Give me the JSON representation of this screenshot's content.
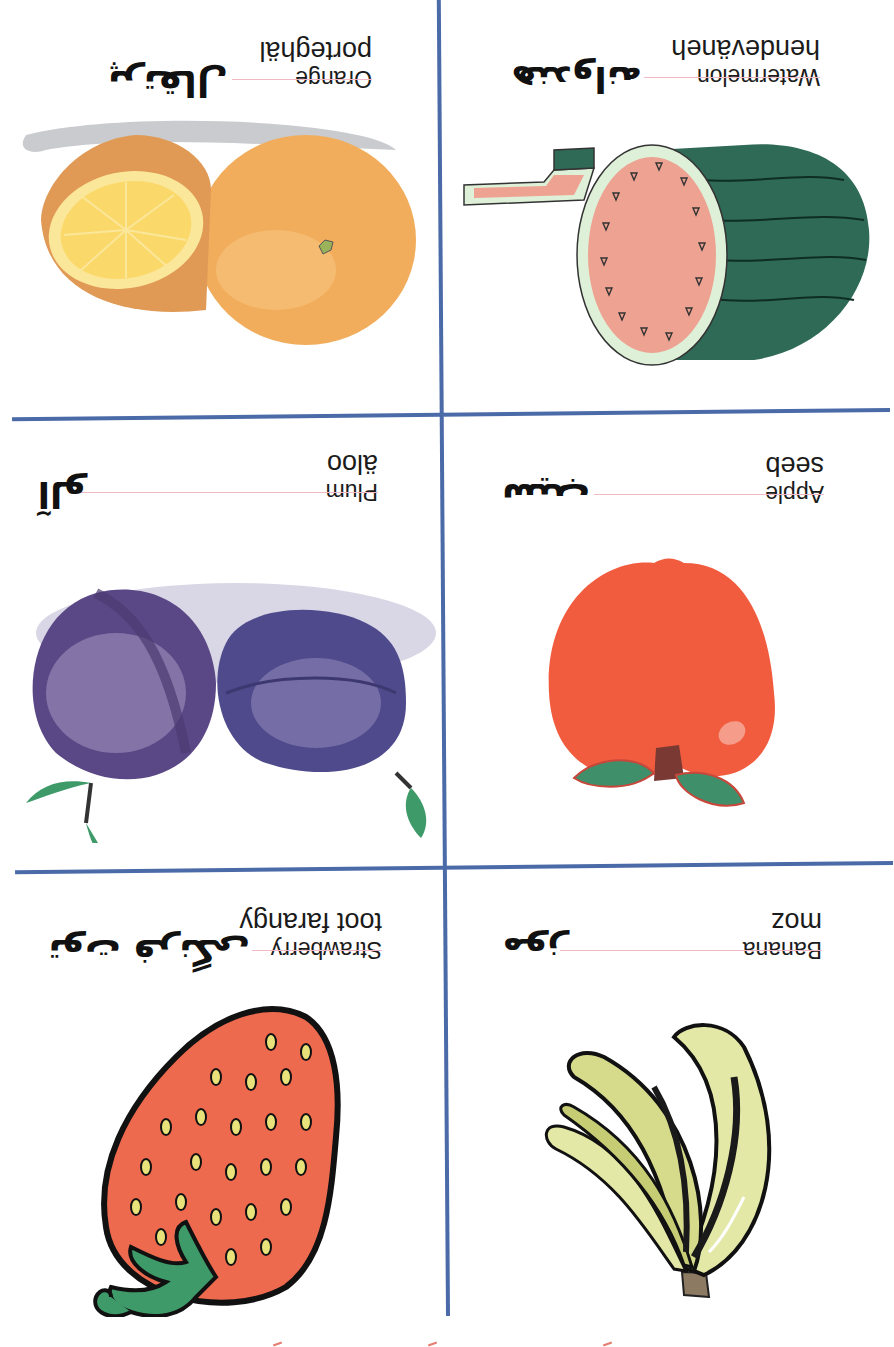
{
  "sheet": {
    "orientation": "rotated-180",
    "grid_color": "#4a6aa8",
    "divider_color": "#f0b9c4"
  },
  "cards": [
    {
      "id": "banana",
      "english": "Banana",
      "transliteration": "moz",
      "persian": "موز",
      "color": "#e4e8a6"
    },
    {
      "id": "strawberry",
      "english": "Strawberry",
      "transliteration": "toot farangy",
      "persian": "توت فرنگی",
      "color": "#ee6a4e"
    },
    {
      "id": "apple",
      "english": "Apple",
      "transliteration": "seeb",
      "persian": "سیب",
      "color": "#f25c3e"
    },
    {
      "id": "plum",
      "english": "Plum",
      "transliteration": "äloo",
      "persian": "آلو",
      "color": "#5a4785"
    },
    {
      "id": "watermelon",
      "english": "Watermelon",
      "transliteration": "hendeväneh",
      "persian": "هندوانه",
      "color": "#2f6a56"
    },
    {
      "id": "orange",
      "english": "Orange",
      "transliteration": "porteghäl",
      "persian": "پرتقال",
      "color": "#f1ad5c"
    }
  ]
}
